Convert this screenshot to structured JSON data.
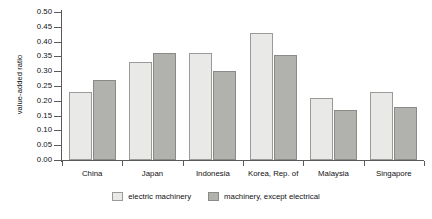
{
  "chart_data": {
    "type": "bar",
    "title": "",
    "xlabel": "",
    "ylabel": "value-added ratio",
    "categories": [
      "China",
      "Japan",
      "Indonesia",
      "Korea, Rep. of",
      "Malaysia",
      "Singapore"
    ],
    "series": [
      {
        "name": "electric machinery",
        "color": "#e9e9e7",
        "values": [
          0.23,
          0.33,
          0.36,
          0.43,
          0.21,
          0.23
        ]
      },
      {
        "name": "machinery, except electrical",
        "color": "#b1b1ad",
        "values": [
          0.27,
          0.36,
          0.3,
          0.355,
          0.17,
          0.18
        ]
      }
    ],
    "ylim": [
      0.0,
      0.5
    ],
    "ytick_values": [
      0.0,
      0.05,
      0.1,
      0.15,
      0.2,
      0.25,
      0.3,
      0.35,
      0.4,
      0.45,
      0.5
    ],
    "ytick_labels": [
      "0.00",
      "0.05",
      "0.10",
      "0.15",
      "0.20",
      "0.25",
      "0.30",
      "0.35",
      "0.40",
      "0.45",
      "0.50"
    ],
    "grid": false,
    "legend_position": "bottom"
  }
}
